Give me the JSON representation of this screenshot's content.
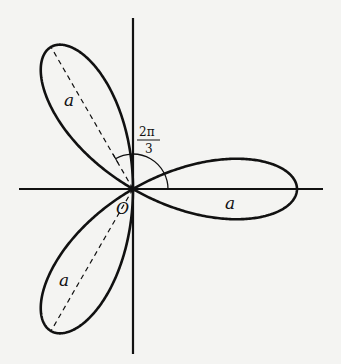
{
  "figure": {
    "type": "three-leaved rose",
    "equation_implied": "r = a cos 3θ",
    "labels": {
      "origin": "O",
      "petal_length_right": "a",
      "petal_length_upper": "a",
      "petal_length_lower": "a",
      "angle_numerator": "2π",
      "angle_denominator": "3"
    },
    "petal_angles_deg": [
      0,
      120,
      240
    ],
    "colors": {
      "background": "#f4f4f2",
      "ink": "#111111"
    }
  }
}
